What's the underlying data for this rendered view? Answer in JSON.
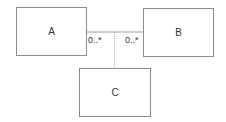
{
  "diagram": {
    "type": "uml-association-class",
    "classes": [
      {
        "id": "A",
        "label": "A"
      },
      {
        "id": "B",
        "label": "B"
      },
      {
        "id": "C",
        "label": "C"
      }
    ],
    "association": {
      "from": "A",
      "to": "B",
      "multiplicity_a": "0..*",
      "multiplicity_b": "0..*",
      "association_class": "C"
    }
  }
}
